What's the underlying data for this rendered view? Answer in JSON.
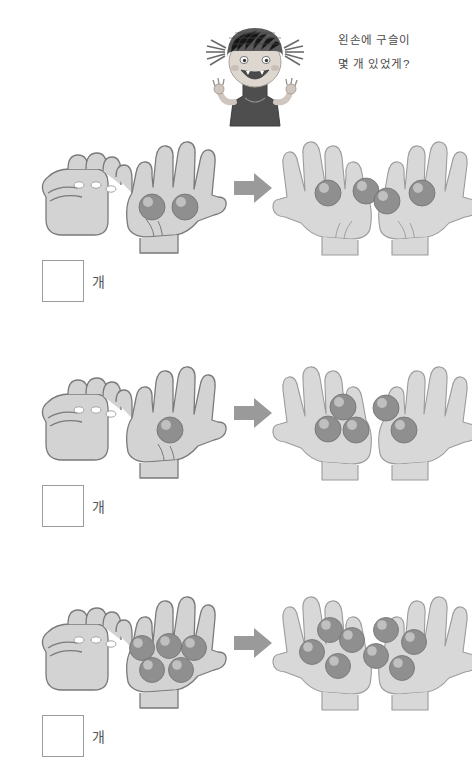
{
  "worksheet": {
    "background_color": "#ffffff",
    "hand_fill": "#d3d3d3",
    "hand_stroke": "#7a7a7a",
    "marble_color": "#8f8f8f",
    "marble_highlight": "#c9c9c9",
    "arrow_color": "#9a9a9a",
    "box_border_color": "#9b9b9b"
  },
  "header": {
    "character": {
      "name": "cartoon-girl-with-pigtails",
      "hair_color": "#5a5a5a",
      "skin_color": "#d8d2cc",
      "shirt_color": "#4e4e4e"
    },
    "question_lines": [
      "왼손에 구슬이",
      "몇 개 있었게?"
    ]
  },
  "problems": [
    {
      "index": 1,
      "left_hand": {
        "pose": "fist",
        "marbles": 0,
        "label": "closed-fist-hidden-marbles"
      },
      "right_hand": {
        "pose": "open-palm",
        "marbles": 2
      },
      "arrow": "arrow-right",
      "total_hands": {
        "left_marbles": 2,
        "right_marbles": 2,
        "total": 4
      },
      "answer_value": "",
      "unit_label": "개"
    },
    {
      "index": 2,
      "left_hand": {
        "pose": "fist",
        "marbles": 0,
        "label": "closed-fist-hidden-marbles"
      },
      "right_hand": {
        "pose": "open-palm",
        "marbles": 1
      },
      "arrow": "arrow-right",
      "total_hands": {
        "left_marbles": 3,
        "right_marbles": 2,
        "total": 5
      },
      "answer_value": "",
      "unit_label": "개"
    },
    {
      "index": 3,
      "left_hand": {
        "pose": "fist",
        "marbles": 0,
        "label": "closed-fist-hidden-marbles"
      },
      "right_hand": {
        "pose": "open-palm",
        "marbles": 5
      },
      "arrow": "arrow-right",
      "total_hands": {
        "left_marbles": 4,
        "right_marbles": 4,
        "total": 8
      },
      "answer_value": "",
      "unit_label": "개"
    }
  ]
}
